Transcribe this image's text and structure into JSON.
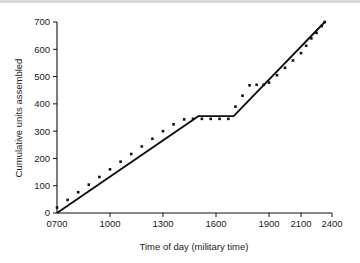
{
  "figure": {
    "kind": "line-chart",
    "background_color": "#ffffff",
    "ink_color": "#111111"
  },
  "chart_data": {
    "type": "line",
    "title": "",
    "xlabel": "Time of day (military time)",
    "ylabel": "Cumulative units assembled",
    "xlim": [
      700,
      2400
    ],
    "ylim": [
      0,
      700
    ],
    "grid": false,
    "legend": "none",
    "x_tick_labels": [
      "0700",
      "1000",
      "1300",
      "1600",
      "1900",
      "2100",
      "2400"
    ],
    "x_tick_values": [
      700,
      1000,
      1300,
      1600,
      1900,
      2100,
      2400
    ],
    "y_tick_labels": [
      "0",
      "100",
      "200",
      "300",
      "400",
      "500",
      "600",
      "700"
    ],
    "y_tick_values": [
      0,
      100,
      200,
      300,
      400,
      500,
      600,
      700
    ],
    "series": [
      {
        "name": "planned-cumulative-output",
        "style": "solid",
        "color": "#111111",
        "x": [
          700,
          1500,
          1700,
          2330
        ],
        "values": [
          0,
          355,
          355,
          700
        ]
      },
      {
        "name": "actual-cumulative-output",
        "style": "dotted",
        "color": "#111111",
        "x": [
          700,
          760,
          820,
          880,
          940,
          1000,
          1060,
          1120,
          1180,
          1240,
          1300,
          1360,
          1420,
          1470,
          1520,
          1570,
          1620,
          1670,
          1710,
          1750,
          1790,
          1830,
          1870,
          1900,
          1950,
          2000,
          2050,
          2100,
          2150,
          2200,
          2250,
          2300,
          2330
        ],
        "values": [
          20,
          48,
          76,
          104,
          132,
          160,
          188,
          216,
          244,
          272,
          300,
          325,
          343,
          345,
          345,
          345,
          345,
          345,
          390,
          430,
          468,
          470,
          470,
          478,
          505,
          532,
          559,
          586,
          613,
          640,
          660,
          685,
          700
        ]
      }
    ],
    "annotations": [
      {
        "name": "plateau-planned",
        "text": "",
        "x_range": [
          1500,
          1700
        ],
        "y": 355
      },
      {
        "name": "plateau-actual",
        "text": "",
        "x_range": [
          1790,
          1890
        ],
        "y": 470
      }
    ]
  }
}
